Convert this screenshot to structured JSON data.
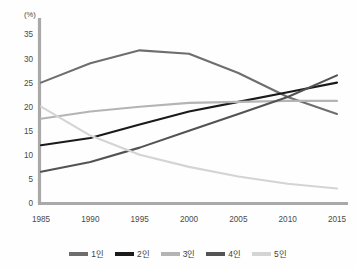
{
  "chart_data": {
    "type": "line",
    "title": "",
    "subtitle": "",
    "xlabel": "",
    "ylabel": "",
    "unit_label": "(%)",
    "categories": [
      "1985",
      "1990",
      "1995",
      "2000",
      "2005",
      "2010",
      "2015"
    ],
    "x": [
      1985,
      1990,
      1995,
      2000,
      2005,
      2010,
      2015
    ],
    "ylim": [
      0,
      38
    ],
    "xlim": [
      1985,
      2015
    ],
    "yticks": [
      0,
      5,
      10,
      15,
      20,
      25,
      30,
      35
    ],
    "ytick_labels": [
      "0",
      "5",
      "10",
      "15",
      "20",
      "25",
      "30",
      "35"
    ],
    "xtick_labels": [
      "1985",
      "1990",
      "1995",
      "2000",
      "2005",
      "2010",
      "2015"
    ],
    "grid": false,
    "legend_position": "bottom",
    "series": [
      {
        "name": "1인",
        "color": "#6e6e6e",
        "values": [
          25.0,
          29.0,
          31.7,
          31.0,
          27.0,
          22.0,
          18.5
        ]
      },
      {
        "name": "2인",
        "color": "#1a1a1a",
        "values": [
          12.0,
          13.5,
          16.3,
          19.0,
          21.0,
          23.0,
          25.0
        ]
      },
      {
        "name": "3인",
        "color": "#b4b4b4",
        "values": [
          17.5,
          19.0,
          20.0,
          20.8,
          21.0,
          21.2,
          21.2
        ]
      },
      {
        "name": "4인",
        "color": "#535353",
        "values": [
          6.5,
          8.5,
          11.5,
          15.0,
          18.5,
          22.0,
          26.5
        ]
      },
      {
        "name": "5인",
        "color": "#d4d4d4",
        "values": [
          20.0,
          14.0,
          10.0,
          7.5,
          5.5,
          4.0,
          3.0
        ]
      }
    ]
  },
  "legend": {
    "items": [
      {
        "label": "1인",
        "color": "#6e6e6e"
      },
      {
        "label": "2인",
        "color": "#1a1a1a"
      },
      {
        "label": "3인",
        "color": "#b4b4b4"
      },
      {
        "label": "4인",
        "color": "#535353"
      },
      {
        "label": "5인",
        "color": "#d4d4d4"
      }
    ]
  },
  "axes": {
    "unit": "(%)",
    "y_ticks": [
      "35",
      "30",
      "25",
      "20",
      "15",
      "10",
      "5",
      "0"
    ],
    "x_ticks": [
      "1985",
      "1990",
      "1995",
      "2000",
      "2005",
      "2010",
      "2015"
    ]
  }
}
